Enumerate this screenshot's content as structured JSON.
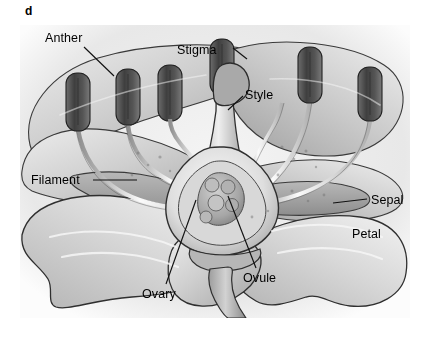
{
  "figure": {
    "panel_letter": "d",
    "style": "grayscale-pencil-illustration",
    "background_color": "#ffffff",
    "ink_color": "#1a1a1a"
  },
  "labels": {
    "anther": "Anther",
    "stigma": "Stigma",
    "style": "Style",
    "filament": "Filament",
    "sepal": "Sepal",
    "petal": "Petal",
    "ovary": "Ovary",
    "ovule": "Ovule"
  },
  "label_positions": {
    "anther": {
      "x": 45,
      "y": 32
    },
    "stigma": {
      "x": 177,
      "y": 44
    },
    "style": {
      "x": 245,
      "y": 89
    },
    "filament": {
      "x": 31,
      "y": 174
    },
    "sepal": {
      "x": 371,
      "y": 194
    },
    "petal": {
      "x": 352,
      "y": 228
    },
    "ovary": {
      "x": 142,
      "y": 288
    },
    "ovule": {
      "x": 243,
      "y": 272
    }
  },
  "structures": {
    "stamen_count": 6,
    "parts": [
      "anther",
      "filament",
      "stigma",
      "style",
      "ovary",
      "ovule",
      "petal",
      "sepal"
    ]
  },
  "palette": {
    "anther_dark": "#4a4a4a",
    "anther_mid": "#6b6b6b",
    "petal_light": "#e2e2e2",
    "petal_mid": "#c4c4c4",
    "petal_shadow": "#9a9a9a",
    "sepal_tone": "#a8a8a8",
    "outline": "#2b2b2b",
    "leader_line": "#111111"
  }
}
